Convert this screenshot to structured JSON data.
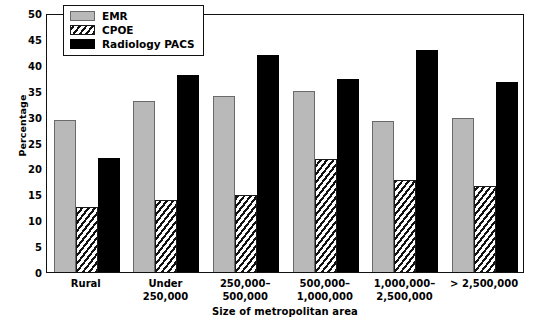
{
  "chart_data": {
    "type": "bar",
    "title": "",
    "xlabel": "Size of metropolitan area",
    "ylabel": "Percentage",
    "ylim": [
      0,
      50
    ],
    "ytick_step": 5,
    "yticks": [
      0,
      5,
      10,
      15,
      20,
      25,
      30,
      35,
      40,
      45,
      50
    ],
    "grid": false,
    "legend_position": "top-left-inside",
    "categories": [
      "Rural",
      "Under\n250,000",
      "250,000–\n500,000",
      "500,000–\n1,000,000",
      "1,000,000–\n2,500,000",
      "> 2,500,000"
    ],
    "series": [
      {
        "name": "EMR",
        "color": "#b9b9b9",
        "pattern": "solid-gray",
        "values": [
          29.4,
          33.0,
          34.0,
          35.0,
          29.2,
          29.7
        ]
      },
      {
        "name": "CPOE",
        "color": "#ffffff",
        "pattern": "diagonal-hatch",
        "values": [
          12.5,
          13.9,
          14.8,
          21.9,
          17.7,
          16.6
        ]
      },
      {
        "name": "Radiology PACS",
        "color": "#000000",
        "pattern": "solid-black",
        "values": [
          22.0,
          38.0,
          41.8,
          37.2,
          42.8,
          36.7
        ]
      }
    ]
  },
  "legend": {
    "items": [
      {
        "label": "EMR",
        "swatch": "gray-swatch"
      },
      {
        "label": "CPOE",
        "swatch": "hatch-swatch"
      },
      {
        "label": "Radiology PACS",
        "swatch": "black-swatch"
      }
    ]
  }
}
